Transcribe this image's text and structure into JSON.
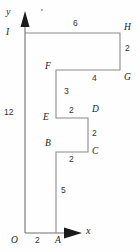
{
  "figure": {
    "axes": {
      "x_label": "x",
      "y_label": "y",
      "origin_label": "O",
      "line_color": "#6e6e6e",
      "arrow_color": "#1a1a1a"
    },
    "shape": {
      "stroke_color": "#8a8a8a",
      "fill_color": "none",
      "path": "M25,33 L120,33 L120,70 L56,70 L56,118 L88,118 L88,152 L56,152 L56,233 L25,233"
    },
    "vertices": [
      {
        "name": "I",
        "label": "I",
        "x": 25,
        "y": 33,
        "label_x": 6,
        "label_y": 28
      },
      {
        "name": "H",
        "label": "H",
        "x": 120,
        "y": 33,
        "label_x": 124,
        "label_y": 23
      },
      {
        "name": "G",
        "label": "G",
        "x": 120,
        "y": 70,
        "label_x": 124,
        "label_y": 73
      },
      {
        "name": "F",
        "label": "F",
        "x": 56,
        "y": 70,
        "label_x": 45,
        "label_y": 62
      },
      {
        "name": "E",
        "label": "E",
        "x": 56,
        "y": 118,
        "label_x": 44,
        "label_y": 118
      },
      {
        "name": "D",
        "label": "D",
        "x": 88,
        "y": 118,
        "label_x": 92,
        "label_y": 110
      },
      {
        "name": "C",
        "label": "C",
        "x": 88,
        "y": 152,
        "label_x": 92,
        "label_y": 154
      },
      {
        "name": "B",
        "label": "B",
        "x": 56,
        "y": 152,
        "label_x": 45,
        "label_y": 144
      },
      {
        "name": "A",
        "label": "A",
        "x": 56,
        "y": 233,
        "label_x": 55,
        "label_y": 238
      },
      {
        "name": "O",
        "label": "O",
        "x": 25,
        "y": 233,
        "label_x": 11,
        "label_y": 238
      }
    ],
    "side_lengths": [
      {
        "name": "length-IH",
        "value": "6",
        "label_x": 73,
        "label_y": 20
      },
      {
        "name": "length-HG",
        "value": "2",
        "label_x": 125,
        "label_y": 47
      },
      {
        "name": "length-FG",
        "value": "4",
        "label_x": 91,
        "label_y": 74
      },
      {
        "name": "length-FE",
        "value": "3",
        "label_x": 64,
        "label_y": 89
      },
      {
        "name": "length-ED",
        "value": "2",
        "label_x": 69,
        "label_y": 109
      },
      {
        "name": "length-DC",
        "value": "2",
        "label_x": 92,
        "label_y": 131
      },
      {
        "name": "length-BC",
        "value": "2",
        "label_x": 69,
        "label_y": 156
      },
      {
        "name": "length-AB",
        "value": "5",
        "label_x": 61,
        "label_y": 188
      },
      {
        "name": "length-OA",
        "value": "2",
        "label_x": 35,
        "label_y": 238
      },
      {
        "name": "length-OI",
        "value": "12",
        "label_x": 5,
        "label_y": 109
      }
    ],
    "axis_labels": [
      {
        "name": "y-axis-label",
        "value": "y",
        "label_x": 6,
        "label_y": 7
      },
      {
        "name": "x-axis-label",
        "value": "x",
        "label_x": 86,
        "label_y": 226
      }
    ]
  }
}
